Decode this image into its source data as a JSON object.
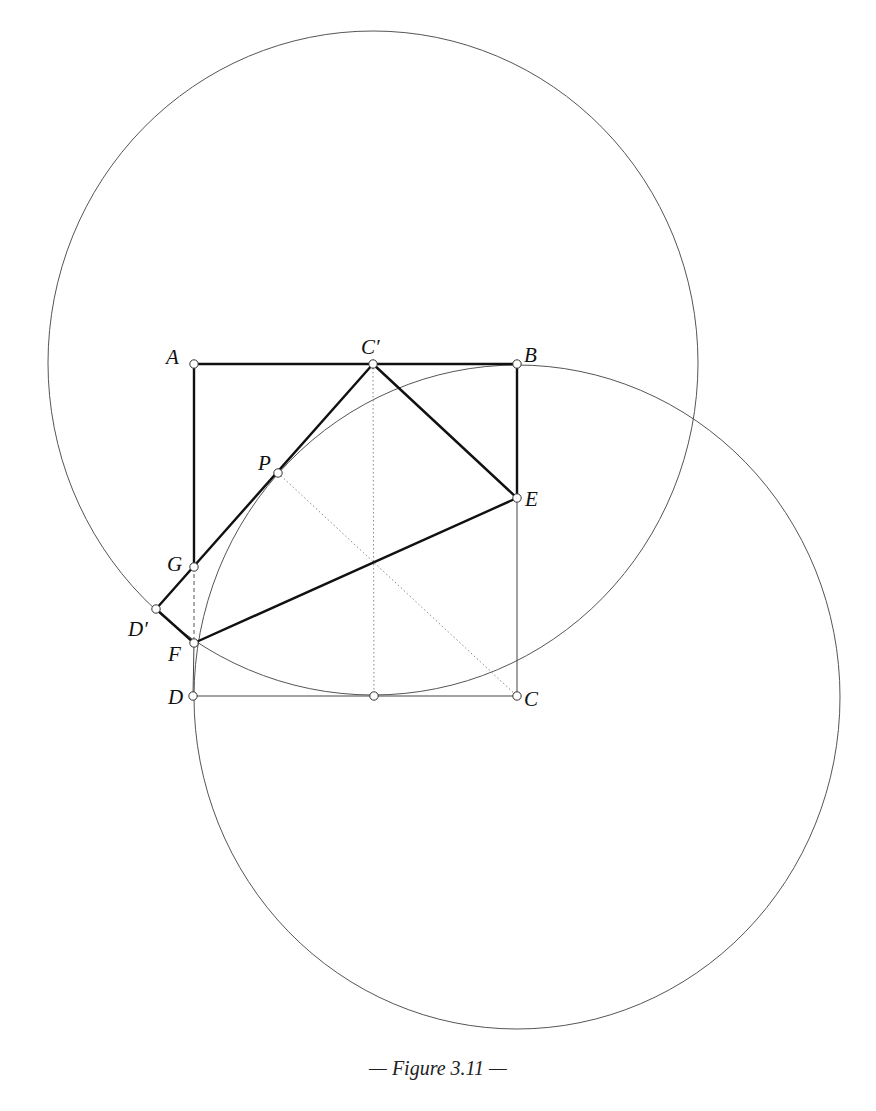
{
  "figure": {
    "caption": "— Figure 3.11 —",
    "colors": {
      "stroke": "#111111",
      "thin": "#555555",
      "dotted": "#888888",
      "background": "#ffffff"
    },
    "points": {
      "A": {
        "label": "A",
        "x": 194,
        "y": 364
      },
      "B": {
        "label": "B",
        "x": 517,
        "y": 364
      },
      "C": {
        "label": "C",
        "x": 517,
        "y": 696
      },
      "D": {
        "label": "D",
        "x": 193,
        "y": 696
      },
      "Cp": {
        "label": "C′",
        "x": 373,
        "y": 364
      },
      "E": {
        "label": "E",
        "x": 517,
        "y": 498
      },
      "P": {
        "label": "P",
        "x": 278,
        "y": 473
      },
      "G": {
        "label": "G",
        "x": 194,
        "y": 567
      },
      "Dp": {
        "label": "D′",
        "x": 156,
        "y": 609
      },
      "F": {
        "label": "F",
        "x": 194,
        "y": 643
      },
      "M": {
        "label": "",
        "x": 374,
        "y": 696
      }
    },
    "circles": [
      {
        "name": "upper-circle",
        "cx": 373,
        "cy": 363,
        "rx": 325,
        "ry": 332
      },
      {
        "name": "lower-circle",
        "cx": 517,
        "cy": 697,
        "rx": 323,
        "ry": 332
      }
    ]
  }
}
